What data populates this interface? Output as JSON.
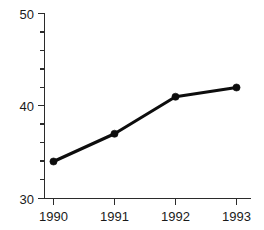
{
  "chart_data": {
    "type": "line",
    "title": "",
    "subtitle": "",
    "xlabel": "",
    "ylabel": "",
    "categories": [
      "1990",
      "1991",
      "1992",
      "1993"
    ],
    "x": [
      1990,
      1991,
      1992,
      1993
    ],
    "values": [
      34,
      37,
      41,
      42
    ],
    "series": [
      {
        "name": "",
        "values": [
          34,
          37,
          41,
          42
        ]
      }
    ],
    "ylim": [
      30,
      50
    ],
    "y_major_ticks": [
      30,
      40,
      50
    ],
    "y_major_tick_labels": [
      "30",
      "40",
      "50"
    ],
    "y_minor_tick_step": 2,
    "x_tick_labels": [
      "1990",
      "1991",
      "1992",
      "1993"
    ],
    "grid": false,
    "legend": null,
    "legend_position": "none",
    "marker": "circle",
    "line_color": "#0d0d0d",
    "marker_color": "#0d0d0d",
    "axis_color": "#2b2b2b",
    "background_color": "#ffffff",
    "annotations": []
  },
  "axis": {
    "y_labels": [
      "50",
      "40",
      "30"
    ],
    "x_labels": [
      "1990",
      "1991",
      "1992",
      "1993"
    ]
  }
}
